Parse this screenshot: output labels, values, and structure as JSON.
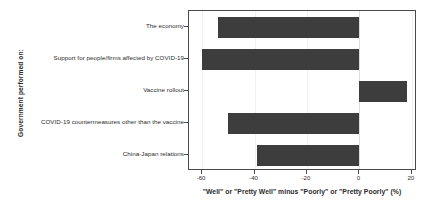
{
  "chart_data": {
    "type": "bar",
    "orientation": "horizontal",
    "title": "",
    "xlabel": "\"Well\" or \"Pretty Well\" minus \"Poorly\" or \"Pretty Poorly\" (%)",
    "ylabel": "Government performed on:",
    "categories": [
      "The economy",
      "Support for people/firms affected by COVID-19",
      "Vaccine rollout",
      "COVID-19 countermeasures other than the vaccine",
      "China-Japan relations"
    ],
    "values": [
      -54,
      -60,
      18,
      -50,
      -39
    ],
    "xlim": [
      -65,
      22
    ],
    "xticks": [
      -60,
      -40,
      -20,
      0,
      20
    ],
    "xticklabels": [
      "-60",
      "-40",
      "-20",
      "0",
      "20"
    ],
    "grid": true,
    "legend": "none",
    "bar_color": "#3d3d3d",
    "frame_color": "#4a4a4a",
    "gridline_color": "#f0f0f0",
    "background": "#ffffff"
  }
}
